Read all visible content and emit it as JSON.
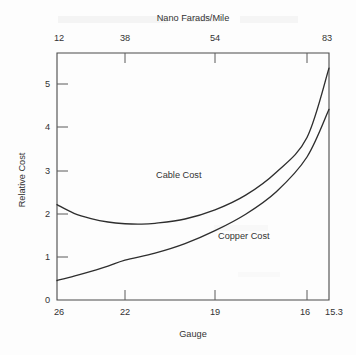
{
  "chart_data": {
    "type": "line",
    "title": "",
    "xlabel": "Gauge",
    "ylabel": "Relative Cost",
    "top_axis_label": "Nano Farads/Mile",
    "grid": false,
    "legend": "inline-annotations",
    "ylim": [
      0,
      5.7
    ],
    "y_ticks": [
      "0",
      "1",
      "2",
      "3",
      "4",
      "5"
    ],
    "y_tick_values": [
      0,
      1,
      2,
      3,
      4,
      5
    ],
    "x_ticks_bottom": [
      "26",
      "22",
      "19",
      "16",
      "15.3"
    ],
    "x_tick_bottom_values": [
      26,
      22,
      19,
      16,
      15.3
    ],
    "x_ticks_top": [
      "12",
      "38",
      "54",
      "83"
    ],
    "x_tick_top_values": [
      12,
      38,
      54,
      83
    ],
    "series": [
      {
        "name": "Cable Cost",
        "label": "Cable Cost",
        "x": [
          26,
          25,
          24,
          23,
          22,
          21.5,
          21,
          20,
          19,
          18,
          17,
          16,
          15.3
        ],
        "values": [
          2.2,
          2.0,
          1.88,
          1.8,
          1.76,
          1.75,
          1.77,
          1.87,
          2.08,
          2.42,
          2.95,
          3.75,
          5.35
        ]
      },
      {
        "name": "Copper Cost",
        "label": "Copper Cost",
        "x": [
          26,
          25,
          24,
          23,
          22,
          21,
          20,
          19,
          18,
          17,
          16,
          15.3
        ],
        "values": [
          0.45,
          0.55,
          0.66,
          0.78,
          0.92,
          1.08,
          1.3,
          1.6,
          1.98,
          2.5,
          3.3,
          4.4
        ]
      }
    ],
    "annotations": [
      {
        "text": "Cable Cost",
        "x_px": 156,
        "y_px": 178
      },
      {
        "text": "Copper Cost",
        "x_px": 218,
        "y_px": 239
      }
    ]
  }
}
